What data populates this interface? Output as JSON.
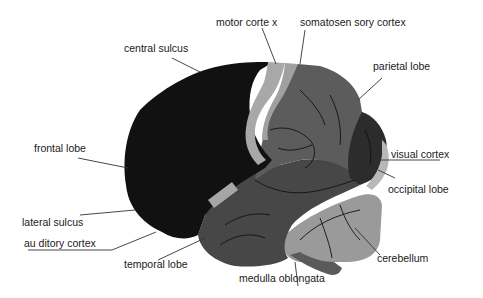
{
  "diagram": {
    "colors": {
      "frontal_lobe": "#111111",
      "motor_cortex": "#a8a8a8",
      "somatosensory_cortex": "#a0a0a0",
      "parietal_lobe": "#5c5c5c",
      "temporal_lobe": "#474747",
      "occipital_lobe": "#2c2c2c",
      "visual_cortex": "#b8b8b8",
      "auditory_cortex": "#a6a6a6",
      "cerebellum": "#9a9a9a",
      "medulla_oblongata": "#5a5a5a"
    },
    "labels": {
      "motor_cortex": "motor corte x",
      "somatosensory_cortex": "somatosen sory cortex",
      "central_sulcus": "central sulcus",
      "parietal_lobe": "parietal lobe",
      "frontal_lobe": "frontal lobe",
      "visual_cortex": "visual cortex",
      "occipital_lobe": "occipital lobe",
      "lateral_sulcus": "lateral sulcus",
      "auditory_cortex": "au ditory cortex",
      "cerebellum": "cerebellum",
      "temporal_lobe": "temporal lobe",
      "medulla_oblongata": "medulla oblongata"
    }
  }
}
